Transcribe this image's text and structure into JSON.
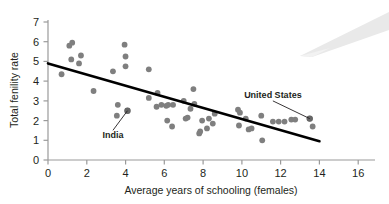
{
  "chart_data": {
    "type": "scatter",
    "title": "",
    "xlabel": "Average years of schooling (females)",
    "ylabel": "Total fenility rate",
    "xlim": [
      0,
      16.8
    ],
    "ylim": [
      0,
      7.4
    ],
    "xticks": [
      0,
      2,
      4,
      6,
      8,
      10,
      12,
      14,
      16
    ],
    "yticks": [
      0,
      1,
      2,
      3,
      4,
      5,
      6,
      7
    ],
    "xtick_labels": [
      "0",
      "2",
      "4",
      "6",
      "8",
      "10",
      "12",
      "14",
      "16"
    ],
    "ytick_labels": [
      "0",
      "1",
      "2",
      "3",
      "4",
      "5",
      "6",
      "7"
    ],
    "grid": false,
    "legend": null,
    "marker_color": "#7f7f7f",
    "line_color": "#000000",
    "axis_color": "#9a9a9a",
    "points": [
      [
        0.7,
        4.35
      ],
      [
        1.1,
        5.8
      ],
      [
        1.25,
        5.95
      ],
      [
        1.2,
        5.1
      ],
      [
        1.6,
        4.9
      ],
      [
        1.7,
        5.3
      ],
      [
        2.35,
        3.5
      ],
      [
        3.35,
        4.5
      ],
      [
        3.6,
        2.8
      ],
      [
        3.55,
        2.25
      ],
      [
        3.95,
        5.85
      ],
      [
        4.0,
        5.25
      ],
      [
        4.0,
        4.75
      ],
      [
        4.1,
        2.5
      ],
      [
        5.2,
        4.6
      ],
      [
        5.2,
        3.15
      ],
      [
        5.65,
        3.4
      ],
      [
        5.6,
        2.7
      ],
      [
        5.85,
        2.8
      ],
      [
        6.1,
        2.75
      ],
      [
        6.2,
        2.8
      ],
      [
        6.15,
        2.0
      ],
      [
        6.4,
        1.7
      ],
      [
        6.45,
        2.8
      ],
      [
        7.0,
        3.0
      ],
      [
        7.1,
        2.1
      ],
      [
        7.2,
        2.15
      ],
      [
        7.35,
        2.6
      ],
      [
        7.5,
        3.6
      ],
      [
        7.55,
        2.85
      ],
      [
        7.8,
        1.35
      ],
      [
        7.85,
        1.45
      ],
      [
        7.95,
        2.0
      ],
      [
        8.2,
        1.6
      ],
      [
        8.3,
        2.1
      ],
      [
        8.5,
        1.85
      ],
      [
        8.6,
        2.35
      ],
      [
        9.8,
        2.55
      ],
      [
        9.9,
        2.4
      ],
      [
        9.85,
        1.75
      ],
      [
        10.2,
        2.1
      ],
      [
        10.35,
        1.55
      ],
      [
        10.5,
        1.6
      ],
      [
        11.0,
        2.25
      ],
      [
        11.05,
        1.0
      ],
      [
        11.6,
        1.95
      ],
      [
        11.9,
        1.95
      ],
      [
        12.2,
        1.95
      ],
      [
        12.55,
        2.05
      ],
      [
        12.75,
        2.05
      ],
      [
        13.5,
        2.1
      ],
      [
        13.65,
        1.7
      ]
    ],
    "trend_line": {
      "x1": 0.0,
      "y1": 4.9,
      "x2": 14.0,
      "y2": 0.95
    },
    "annotations": [
      {
        "label": "India",
        "point": [
          4.1,
          2.5
        ],
        "text_x": 3.35,
        "text_y": 1.1
      },
      {
        "label": "United States",
        "point": [
          13.5,
          2.1
        ],
        "text_x": 11.6,
        "text_y": 3.15
      }
    ]
  }
}
